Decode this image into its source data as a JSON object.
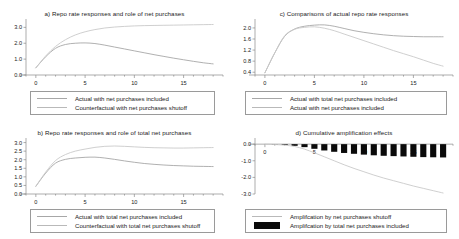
{
  "figure": {
    "background": "#ffffff",
    "line_color_light": "#c2c2c2",
    "line_color_dark": "#9f9f9f",
    "bar_color": "#0a0a0a",
    "axis_color": "#8a8a8a",
    "text_color": "#1a1a1a"
  },
  "chart_data": [
    {
      "id": "panel_a",
      "type": "line",
      "title": "a) Repo rate responses and role of  net purchases",
      "xlabel": "",
      "ylabel": "",
      "xlim": [
        -1,
        19
      ],
      "ylim": [
        0.0,
        3.4
      ],
      "xticks": [
        0,
        5,
        10,
        15
      ],
      "xticklabels": [
        "0",
        "5",
        "10",
        "15"
      ],
      "yticks": [
        0.0,
        1.0,
        2.0,
        3.0
      ],
      "yticklabels": [
        "0.0",
        "1.0",
        "2.0",
        "3.0"
      ],
      "grid": false,
      "legend_position": "below",
      "x": [
        0,
        1,
        2,
        3,
        4,
        5,
        6,
        7,
        8,
        9,
        10,
        11,
        12,
        13,
        14,
        15,
        16,
        17,
        18
      ],
      "series": [
        {
          "name": "Actual with net purchases  included",
          "style": "line",
          "color": "#a7a7a7",
          "values": [
            0.45,
            1.15,
            1.68,
            1.92,
            2.0,
            2.02,
            1.98,
            1.88,
            1.76,
            1.64,
            1.52,
            1.4,
            1.28,
            1.17,
            1.06,
            0.96,
            0.86,
            0.77,
            0.7
          ]
        },
        {
          "name": "Counterfactual with net purchases shutoff",
          "style": "line",
          "color": "#c9c9c9",
          "values": [
            0.45,
            1.2,
            1.8,
            2.22,
            2.52,
            2.72,
            2.86,
            2.96,
            3.02,
            3.06,
            3.09,
            3.11,
            3.12,
            3.13,
            3.14,
            3.15,
            3.16,
            3.17,
            3.18
          ]
        }
      ]
    },
    {
      "id": "panel_c",
      "type": "line",
      "title": "c) Comparisons of actual repo rate responses",
      "xlabel": "",
      "ylabel": "",
      "xlim": [
        -1,
        19
      ],
      "ylim": [
        0.3,
        2.25
      ],
      "xticks": [
        0,
        5,
        10,
        15
      ],
      "xticklabels": [
        "0",
        "5",
        "10",
        "15"
      ],
      "yticks": [
        0.4,
        0.8,
        1.2,
        1.6,
        2.0
      ],
      "yticklabels": [
        "0.4",
        "0.8",
        "1.2",
        "1.6",
        "2.0"
      ],
      "grid": false,
      "legend_position": "below",
      "x": [
        0,
        1,
        2,
        3,
        4,
        5,
        6,
        7,
        8,
        9,
        10,
        11,
        12,
        13,
        14,
        15,
        16,
        17,
        18
      ],
      "series": [
        {
          "name": "Actual with total net purchases  included",
          "style": "line",
          "color": "#a7a7a7",
          "values": [
            0.38,
            1.1,
            1.7,
            1.96,
            2.06,
            2.1,
            2.11,
            2.06,
            1.98,
            1.9,
            1.84,
            1.79,
            1.75,
            1.72,
            1.7,
            1.69,
            1.68,
            1.68,
            1.68
          ]
        },
        {
          "name": "Actual with net purchases  included",
          "style": "line",
          "color": "#c9c9c9",
          "values": [
            0.38,
            1.1,
            1.72,
            1.95,
            2.02,
            2.04,
            1.99,
            1.9,
            1.78,
            1.66,
            1.54,
            1.42,
            1.3,
            1.18,
            1.07,
            0.96,
            0.84,
            0.72,
            0.62
          ]
        }
      ]
    },
    {
      "id": "panel_b",
      "type": "line",
      "title": "b) Repo rate responses and role of total net purchases",
      "xlabel": "",
      "ylabel": "",
      "xlim": [
        -1,
        19
      ],
      "ylim": [
        0.0,
        3.15
      ],
      "xticks": [
        0,
        5,
        10,
        15
      ],
      "xticklabels": [
        "0",
        "5",
        "10",
        "15"
      ],
      "yticks": [
        0.0,
        0.5,
        1.0,
        1.5,
        2.0,
        2.5,
        3.0
      ],
      "yticklabels": [
        "0.0",
        "0.5",
        "1.0",
        "1.5",
        "2.0",
        "2.5",
        "3.0"
      ],
      "grid": false,
      "legend_position": "below",
      "x": [
        0,
        1,
        2,
        3,
        4,
        5,
        6,
        7,
        8,
        9,
        10,
        11,
        12,
        13,
        14,
        15,
        16,
        17,
        18
      ],
      "series": [
        {
          "name": "Actual with total net purchases  included",
          "style": "line",
          "color": "#a7a7a7",
          "values": [
            0.45,
            1.22,
            1.8,
            2.02,
            2.1,
            2.14,
            2.15,
            2.1,
            2.02,
            1.93,
            1.85,
            1.78,
            1.73,
            1.69,
            1.66,
            1.64,
            1.62,
            1.61,
            1.6
          ]
        },
        {
          "name": "Counterfactual with total net purchases shutoff",
          "style": "line",
          "color": "#c9c9c9",
          "values": [
            0.45,
            1.28,
            1.95,
            2.3,
            2.5,
            2.62,
            2.72,
            2.78,
            2.8,
            2.78,
            2.75,
            2.72,
            2.7,
            2.69,
            2.68,
            2.68,
            2.69,
            2.7,
            2.71
          ]
        }
      ]
    },
    {
      "id": "panel_d",
      "type": "bar",
      "title": "d) Cumulative amplification effects",
      "xlabel": "",
      "ylabel": "",
      "xlim": [
        -1,
        19
      ],
      "ylim": [
        -3.0,
        0.25
      ],
      "xticks": [
        0,
        5,
        10,
        15
      ],
      "xticklabels": [
        "0",
        "5",
        "10",
        "15"
      ],
      "yticks": [
        0.0,
        -1.0,
        -2.0,
        -3.0
      ],
      "yticklabels": [
        "0.0",
        "-1.0",
        "-2.0",
        "-3.0"
      ],
      "grid": false,
      "legend_position": "below",
      "categories": [
        0,
        1,
        2,
        3,
        4,
        5,
        6,
        7,
        8,
        9,
        10,
        11,
        12,
        13,
        14,
        15,
        16,
        17,
        18
      ],
      "series": [
        {
          "name": "Amplifcation by net purchases shutoff",
          "style": "line",
          "color": "#c9c9c9",
          "values": [
            0.0,
            -0.02,
            -0.06,
            -0.14,
            -0.3,
            -0.52,
            -0.76,
            -1.0,
            -1.24,
            -1.46,
            -1.66,
            -1.86,
            -2.04,
            -2.2,
            -2.36,
            -2.52,
            -2.66,
            -2.8,
            -2.94
          ]
        },
        {
          "name": "Amplifcation by total net purchases  included",
          "style": "bar",
          "color": "#0a0a0a",
          "values": [
            0.0,
            -0.01,
            -0.04,
            -0.1,
            -0.18,
            -0.28,
            -0.38,
            -0.46,
            -0.53,
            -0.58,
            -0.63,
            -0.67,
            -0.7,
            -0.72,
            -0.74,
            -0.76,
            -0.78,
            -0.79,
            -0.8
          ]
        }
      ]
    }
  ]
}
